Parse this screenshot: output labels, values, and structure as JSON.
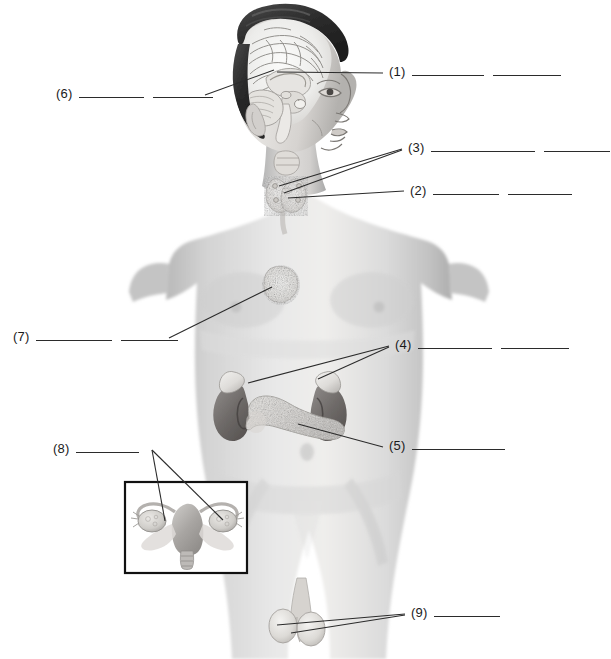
{
  "figure": {
    "title_alt": "Unlabeled endocrine system diagram of a male torso with numbered answer blanks",
    "view": "anterior male torso with mid-sagittal head section and female reproductive inset",
    "background_color": "#ffffff",
    "line_color": "#2b2b2b",
    "text_color": "#1a1a1a"
  },
  "labels": [
    {
      "id": "1",
      "number": "(1)",
      "blanks": 2,
      "blank_widths": [
        72,
        68
      ],
      "text_x": 389,
      "text_y": 78,
      "side": "right",
      "points_to": "pituitary gland region in brain",
      "leaders": [
        {
          "x1": 383,
          "y1": 73,
          "x2": 277,
          "y2": 72
        }
      ]
    },
    {
      "id": "2",
      "number": "(2)",
      "blanks": 2,
      "blank_widths": [
        66,
        64
      ],
      "text_x": 410,
      "text_y": 197,
      "side": "right",
      "points_to": "thyroid gland",
      "leaders": [
        {
          "x1": 404,
          "y1": 191,
          "x2": 288,
          "y2": 198
        }
      ]
    },
    {
      "id": "3",
      "number": "(3)",
      "blanks": 2,
      "blank_widths": [
        104,
        66
      ],
      "text_x": 408,
      "text_y": 154,
      "side": "right",
      "points_to": "parathyroid glands",
      "leaders": [
        {
          "x1": 402,
          "y1": 149,
          "x2": 279,
          "y2": 186
        },
        {
          "x1": 402,
          "y1": 150,
          "x2": 284,
          "y2": 193
        }
      ]
    },
    {
      "id": "4",
      "number": "(4)",
      "blanks": 2,
      "blank_widths": [
        74,
        68
      ],
      "text_x": 395,
      "text_y": 351,
      "side": "right",
      "points_to": "adrenal glands",
      "leaders": [
        {
          "x1": 389,
          "y1": 346,
          "x2": 248,
          "y2": 383
        },
        {
          "x1": 389,
          "y1": 347,
          "x2": 318,
          "y2": 379
        }
      ]
    },
    {
      "id": "5",
      "number": "(5)",
      "blanks": 1,
      "blank_widths": [
        93
      ],
      "text_x": 389,
      "text_y": 452,
      "side": "right",
      "points_to": "pancreas",
      "leaders": [
        {
          "x1": 383,
          "y1": 447,
          "x2": 298,
          "y2": 424
        }
      ]
    },
    {
      "id": "6",
      "number": "(6)",
      "blanks": 2,
      "blank_widths": [
        65,
        60
      ],
      "text_x": 56,
      "text_y": 100,
      "side": "left",
      "points_to": "hypothalamus region in brain",
      "leaders": [
        {
          "x1": 205,
          "y1": 95,
          "x2": 274,
          "y2": 70
        }
      ]
    },
    {
      "id": "7",
      "number": "(7)",
      "blanks": 2,
      "blank_widths": [
        76,
        57
      ],
      "text_x": 13,
      "text_y": 343,
      "side": "left",
      "points_to": "thymus",
      "leaders": [
        {
          "x1": 169,
          "y1": 338,
          "x2": 272,
          "y2": 287
        }
      ]
    },
    {
      "id": "8",
      "number": "(8)",
      "blanks": 1,
      "blank_widths": [
        63
      ],
      "text_x": 53,
      "text_y": 455,
      "side": "left",
      "points_to": "ovaries in inset",
      "leaders": [
        {
          "x1": 152,
          "y1": 450,
          "x2": 165,
          "y2": 521
        },
        {
          "x1": 152,
          "y1": 450,
          "x2": 223,
          "y2": 520
        }
      ]
    },
    {
      "id": "9",
      "number": "(9)",
      "blanks": 1,
      "blank_widths": [
        66
      ],
      "text_x": 411,
      "text_y": 619,
      "side": "right",
      "points_to": "testes",
      "leaders": [
        {
          "x1": 405,
          "y1": 614,
          "x2": 277,
          "y2": 625
        },
        {
          "x1": 405,
          "y1": 615,
          "x2": 291,
          "y2": 633
        }
      ]
    }
  ],
  "inset": {
    "name": "female-reproductive-inset",
    "x": 125,
    "y": 482,
    "width": 122,
    "height": 91,
    "border_color": "#111111",
    "contents": "uterus with fallopian tubes and ovaries"
  },
  "anatomy_parts": [
    {
      "name": "brain-sagittal-section",
      "region": "head"
    },
    {
      "name": "pituitary-gland",
      "region": "head"
    },
    {
      "name": "hypothalamus",
      "region": "head"
    },
    {
      "name": "thyroid-gland",
      "region": "neck"
    },
    {
      "name": "parathyroid-glands",
      "region": "neck"
    },
    {
      "name": "thymus",
      "region": "chest"
    },
    {
      "name": "adrenal-glands",
      "region": "abdomen"
    },
    {
      "name": "kidneys",
      "region": "abdomen"
    },
    {
      "name": "pancreas",
      "region": "abdomen"
    },
    {
      "name": "ovaries",
      "region": "inset"
    },
    {
      "name": "uterus",
      "region": "inset"
    },
    {
      "name": "testes",
      "region": "pelvis"
    }
  ]
}
